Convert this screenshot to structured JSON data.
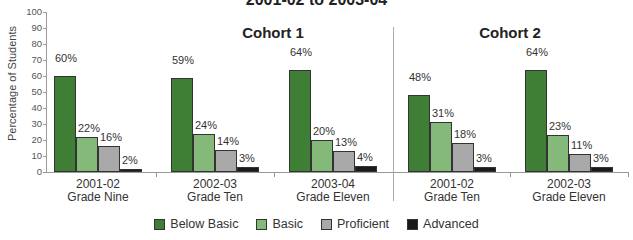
{
  "chart_data": {
    "type": "bar",
    "title": "2001-02 to 2003-04",
    "xlabel": "",
    "ylabel": "Percentage of Students",
    "ylim": [
      0,
      100
    ],
    "yticks": [
      0,
      10,
      20,
      30,
      40,
      50,
      60,
      70,
      80,
      90,
      100
    ],
    "grid": false,
    "legend_position": "bottom",
    "groups": [
      {
        "name": "Cohort 1",
        "categories": [
          "2001-02 Grade Nine",
          "2002-03 Grade Ten",
          "2003-04 Grade Eleven"
        ]
      },
      {
        "name": "Cohort 2",
        "categories": [
          "2001-02 Grade Ten",
          "2002-03 Grade Eleven"
        ]
      }
    ],
    "categories": [
      {
        "year": "2001-02",
        "grade": "Grade Nine"
      },
      {
        "year": "2002-03",
        "grade": "Grade Ten"
      },
      {
        "year": "2003-04",
        "grade": "Grade Eleven"
      },
      {
        "year": "2001-02",
        "grade": "Grade Ten"
      },
      {
        "year": "2002-03",
        "grade": "Grade Eleven"
      }
    ],
    "series": [
      {
        "name": "Below Basic",
        "color": "#3f7f35",
        "values": [
          60,
          59,
          64,
          48,
          64
        ]
      },
      {
        "name": "Basic",
        "color": "#84b97a",
        "values": [
          22,
          24,
          20,
          31,
          23
        ]
      },
      {
        "name": "Proficient",
        "color": "#a9a9a9",
        "values": [
          16,
          14,
          13,
          18,
          11
        ]
      },
      {
        "name": "Advanced",
        "color": "#1a1a1a",
        "values": [
          2,
          3,
          4,
          3,
          3
        ]
      }
    ]
  },
  "labels": {
    "title": "2001-02 to 2003-04",
    "cohort1": "Cohort 1",
    "cohort2": "Cohort 2",
    "ylabel": "Percentage of Students"
  }
}
